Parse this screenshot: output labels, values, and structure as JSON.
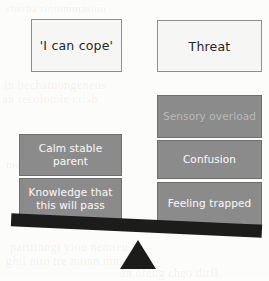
{
  "diagram": {
    "type": "balance-scale",
    "title_boxes": [
      {
        "id": "cope",
        "label": "'I can cope'"
      },
      {
        "id": "threat",
        "label": "Threat"
      }
    ],
    "left_pan": {
      "heading": "'I can cope'",
      "items": [
        {
          "id": "calm",
          "label": "Calm stable parent"
        },
        {
          "id": "knowledge",
          "label": "Knowledge that this will pass"
        }
      ]
    },
    "right_pan": {
      "heading": "Threat",
      "items": [
        {
          "id": "sensory",
          "label": "Sensory overload"
        },
        {
          "id": "confusion",
          "label": "Confusion"
        },
        {
          "id": "feeling",
          "label": "Feeling trapped"
        }
      ]
    },
    "beam": {
      "tilt": "right-side-down"
    },
    "fulcrum": {
      "shape": "triangle"
    },
    "colors": {
      "factor_fill": "#8b8b8b",
      "factor_text": "#f2f2f2",
      "label_fill": "#f6f6f4",
      "label_border": "#8f8f8f",
      "beam": "#1c1c1c",
      "background": "#fcfcfa"
    },
    "ghost_text": {
      "line1": "sherba rinnimmasion",
      "line2": "in bechatuongeneus",
      "line3": "an recolomie crish",
      "line4": "menant orgam",
      "line5": "parttinngi yiou nemteu",
      "line6": "ghil nito tre monn mmarst",
      "line7": "an ofeng cheo dirll"
    }
  }
}
